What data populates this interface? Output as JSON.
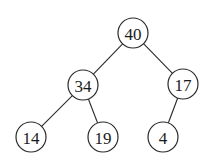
{
  "diagram": {
    "type": "binary-tree",
    "colors": {
      "stroke": "#2a2a2a",
      "text": "#1a1a1a",
      "background": "#ffffff"
    },
    "node_radius": 15,
    "nodes": [
      {
        "id": "n40",
        "label": "40",
        "x": 133,
        "y": 33
      },
      {
        "id": "n34",
        "label": "34",
        "x": 83,
        "y": 85
      },
      {
        "id": "n17",
        "label": "17",
        "x": 183,
        "y": 84
      },
      {
        "id": "n14",
        "label": "14",
        "x": 31,
        "y": 137
      },
      {
        "id": "n19",
        "label": "19",
        "x": 103,
        "y": 137
      },
      {
        "id": "n4",
        "label": "4",
        "x": 163,
        "y": 137
      }
    ],
    "edges": [
      {
        "from": "n40",
        "to": "n34"
      },
      {
        "from": "n40",
        "to": "n17"
      },
      {
        "from": "n34",
        "to": "n14"
      },
      {
        "from": "n34",
        "to": "n19"
      },
      {
        "from": "n17",
        "to": "n4"
      }
    ]
  }
}
